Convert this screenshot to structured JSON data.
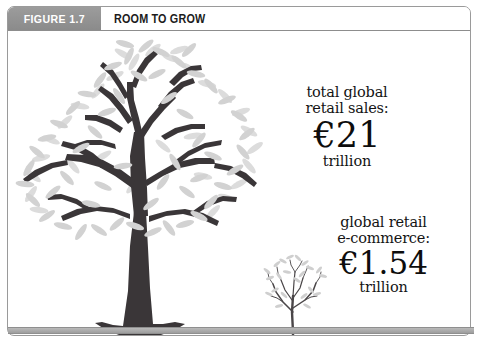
{
  "figure": {
    "tab_label": "FIGURE 1.7",
    "title": "ROOM TO GROW"
  },
  "callouts": [
    {
      "id": "total-retail-sales",
      "line1": "total global",
      "line2": "retail sales:",
      "amount": "€21",
      "unit": "trillion",
      "currency": "EUR",
      "value": 21,
      "scale": "trillion"
    },
    {
      "id": "global-retail-ecommerce",
      "line1": "global retail",
      "line2": "e-commerce:",
      "amount": "€1.54",
      "unit": "trillion",
      "currency": "EUR",
      "value": 1.54,
      "scale": "trillion"
    }
  ],
  "illustration": {
    "big_tree_name": "large-tree",
    "small_tree_name": "small-tree-sapling",
    "ground_name": "ground-bar"
  },
  "colors": {
    "tab_gray": "#949494",
    "header_text": "#1c1c1c",
    "tab_text": "#ffffff",
    "branch_dark": "#3a3638",
    "leaf_gray": "#d3d3d3",
    "leaf_gray_light": "#dcdcdc",
    "ground_gray": "#aeaeae",
    "frame_border": "#9a9a9a",
    "text_black": "#141414",
    "background": "#ffffff"
  }
}
